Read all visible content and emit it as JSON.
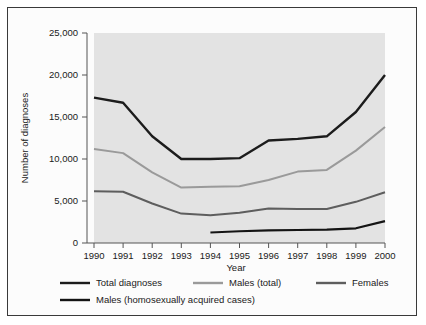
{
  "chart_data": {
    "type": "line",
    "title": "",
    "xlabel": "Year",
    "ylabel": "Number of diagnoses",
    "x": [
      1990,
      1991,
      1992,
      1993,
      1994,
      1995,
      1996,
      1997,
      1998,
      1999,
      2000
    ],
    "categories": [
      "1990",
      "1991",
      "1992",
      "1993",
      "1994",
      "1995",
      "1996",
      "1997",
      "1998",
      "1999",
      "2000"
    ],
    "xlim": [
      1990,
      2000
    ],
    "ylim": [
      0,
      25000
    ],
    "yticks": [
      0,
      5000,
      10000,
      15000,
      20000,
      25000
    ],
    "ytick_labels": [
      "0",
      "5,000",
      "10,000",
      "15,000",
      "20,000",
      "25,000"
    ],
    "grid": false,
    "legend_position": "bottom",
    "plot_background": "#e3e3e3",
    "series": [
      {
        "name": "Total diagnoses",
        "color": "#1c1c1c",
        "width": 2.4,
        "x": [
          1990,
          1991,
          1992,
          1993,
          1994,
          1995,
          1996,
          1997,
          1998,
          1999,
          2000
        ],
        "values": [
          17300,
          16700,
          12700,
          10000,
          10000,
          10100,
          12200,
          12400,
          12700,
          15600,
          20000
        ]
      },
      {
        "name": "Males (total)",
        "color": "#9a9a9a",
        "width": 2.0,
        "x": [
          1990,
          1991,
          1992,
          1993,
          1994,
          1995,
          1996,
          1997,
          1998,
          1999,
          2000
        ],
        "values": [
          11200,
          10700,
          8400,
          6600,
          6700,
          6750,
          7500,
          8500,
          8700,
          11000,
          13800
        ]
      },
      {
        "name": "Females",
        "color": "#5e5e5e",
        "width": 2.0,
        "x": [
          1990,
          1991,
          1992,
          1993,
          1994,
          1995,
          1996,
          1997,
          1998,
          1999,
          2000
        ],
        "values": [
          6150,
          6100,
          4700,
          3500,
          3300,
          3600,
          4100,
          4050,
          4050,
          4900,
          6050
        ]
      },
      {
        "name": "Males (homosexually acquired cases)",
        "color": "#141414",
        "width": 2.2,
        "x": [
          1994,
          1995,
          1996,
          1997,
          1998,
          1999,
          2000
        ],
        "values": [
          1250,
          1400,
          1500,
          1550,
          1600,
          1750,
          2600
        ]
      }
    ]
  },
  "legend": {
    "items": [
      {
        "label": "Total diagnoses",
        "color": "#1c1c1c"
      },
      {
        "label": "Males (total)",
        "color": "#9a9a9a"
      },
      {
        "label": "Females",
        "color": "#5e5e5e"
      },
      {
        "label": "Males (homosexually acquired cases)",
        "color": "#141414"
      }
    ]
  }
}
